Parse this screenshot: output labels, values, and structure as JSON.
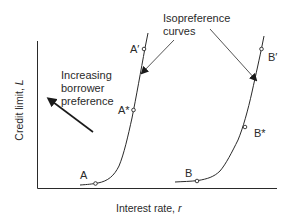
{
  "diagram": {
    "axes": {
      "x_label": "Interest rate, ",
      "x_var": "r",
      "y_label": "Credit limit, ",
      "y_var": "L"
    },
    "annotations": {
      "isopreference_line1": "Isopreference",
      "isopreference_line2": "curves",
      "preference_line1": "Increasing",
      "preference_line2": "borrower",
      "preference_line3": "preference"
    },
    "curves": [
      {
        "id": "A",
        "points": [
          {
            "label": "A",
            "role": "base"
          },
          {
            "label": "A*",
            "role": "middle"
          },
          {
            "label": "A′",
            "role": "top"
          }
        ]
      },
      {
        "id": "B",
        "points": [
          {
            "label": "B",
            "role": "base"
          },
          {
            "label": "B*",
            "role": "middle"
          },
          {
            "label": "B′",
            "role": "top"
          }
        ]
      }
    ],
    "colors": {
      "line": "#2a2a2a",
      "background": "#ffffff"
    }
  }
}
